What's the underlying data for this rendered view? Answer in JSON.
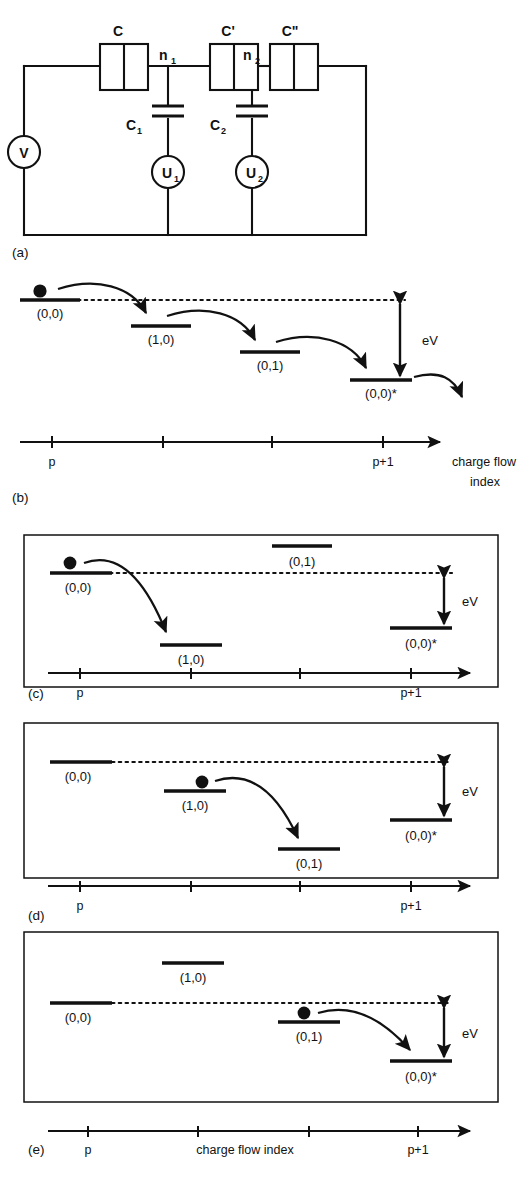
{
  "figure": {
    "type": "physics-schematic"
  },
  "panel_a": {
    "tag": "(a)",
    "junctions": [
      {
        "name": "junction-C",
        "label": "C"
      },
      {
        "name": "junction-Cp",
        "label": "C'"
      },
      {
        "name": "junction-Cpp",
        "label": "C\""
      }
    ],
    "nodes": [
      {
        "name": "node-n1",
        "label": "n",
        "sub": "1"
      },
      {
        "name": "node-n2",
        "label": "n",
        "sub": "2"
      }
    ],
    "capacitors": [
      {
        "name": "capacitor-C1",
        "label": "C",
        "sub": "1"
      },
      {
        "name": "capacitor-C2",
        "label": "C",
        "sub": "2"
      }
    ],
    "sources": [
      {
        "name": "source-V",
        "label": "V",
        "sub": ""
      },
      {
        "name": "source-U1",
        "label": "U",
        "sub": "1"
      },
      {
        "name": "source-U2",
        "label": "U",
        "sub": "2"
      }
    ]
  },
  "panel_b": {
    "tag": "(b)",
    "levels": [
      {
        "state": "(0,0)",
        "has_electron": true
      },
      {
        "state": "(1,0)",
        "has_electron": false
      },
      {
        "state": "(0,1)",
        "has_electron": false
      },
      {
        "state": "(0,0)*",
        "has_electron": false
      }
    ],
    "energy_label": "eV",
    "axis": {
      "tick_labels": [
        "p",
        "p+1"
      ],
      "title_line1": "charge flow",
      "title_line2": "index",
      "ticks": 4
    }
  },
  "panel_c": {
    "tag": "(c)",
    "levels": [
      {
        "state": "(0,0)",
        "has_electron": true
      },
      {
        "state": "(1,0)",
        "has_electron": false
      },
      {
        "state": "(0,1)",
        "has_electron": false
      },
      {
        "state": "(0,0)*",
        "has_electron": false
      }
    ],
    "energy_label": "eV",
    "axis": {
      "tick_labels": [
        "p",
        "p+1"
      ],
      "title": "",
      "ticks": 4
    }
  },
  "panel_d": {
    "tag": "(d)",
    "levels": [
      {
        "state": "(0,0)",
        "has_electron": false
      },
      {
        "state": "(1,0)",
        "has_electron": true
      },
      {
        "state": "(0,1)",
        "has_electron": false
      },
      {
        "state": "(0,0)*",
        "has_electron": false
      }
    ],
    "energy_label": "eV",
    "axis": {
      "tick_labels": [
        "p",
        "p+1"
      ],
      "title": "",
      "ticks": 4
    }
  },
  "panel_e": {
    "tag": "(e)",
    "levels": [
      {
        "state": "(0,0)",
        "has_electron": false
      },
      {
        "state": "(1,0)",
        "has_electron": false
      },
      {
        "state": "(0,1)",
        "has_electron": true
      },
      {
        "state": "(0,0)*",
        "has_electron": false
      }
    ],
    "energy_label": "eV",
    "axis": {
      "tick_labels": [
        "p",
        "p+1"
      ],
      "title": "charge flow index",
      "ticks": 4
    }
  },
  "colors": {
    "ink": "#111111",
    "background": "#ffffff"
  }
}
